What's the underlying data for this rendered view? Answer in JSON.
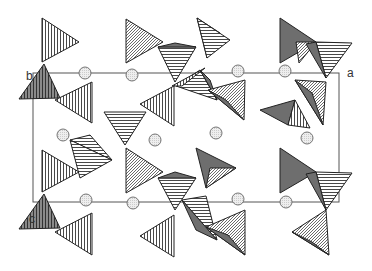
{
  "diagram": {
    "type": "crystal-structure-polyhedral-projection",
    "colors": {
      "background": "#ffffff",
      "dark_face": "#6e6e6e",
      "outline": "#222222",
      "cell_line": "#555555",
      "atom_fill": "#e6e6e6",
      "atom_stroke": "#666666"
    },
    "unit_cell": {
      "x": 33,
      "y": 73,
      "width": 306,
      "height": 129
    },
    "axis_labels": [
      {
        "id": "b",
        "text": "b",
        "x": 26,
        "y": 69
      },
      {
        "id": "a",
        "text": "a",
        "x": 347,
        "y": 66
      },
      {
        "id": "c",
        "text": "c",
        "x": 29,
        "y": 212
      }
    ],
    "atoms": [
      {
        "x": 85,
        "y": 73
      },
      {
        "x": 132,
        "y": 75
      },
      {
        "x": 238,
        "y": 71
      },
      {
        "x": 285,
        "y": 71
      },
      {
        "x": 63,
        "y": 135
      },
      {
        "x": 155,
        "y": 140
      },
      {
        "x": 216,
        "y": 133
      },
      {
        "x": 307,
        "y": 138
      },
      {
        "x": 86,
        "y": 200
      },
      {
        "x": 133,
        "y": 203
      },
      {
        "x": 238,
        "y": 199
      },
      {
        "x": 286,
        "y": 202
      }
    ],
    "polyhedra": [
      {
        "pts": "42,18 42,62 79,42",
        "fill": "vstripe"
      },
      {
        "pts": "19,99 44,64 60,98",
        "fill": "vstripe-dark"
      },
      {
        "pts": "55,100 92,82 92,123",
        "fill": "vstripe"
      },
      {
        "pts": "126,19 126,63 163,42",
        "fill": "diag"
      },
      {
        "pts": "158,47 196,47 175,82",
        "fill": "hstripe"
      },
      {
        "pts": "158,47 175,43 196,47",
        "fill": "dark"
      },
      {
        "pts": "197,18 220,33 207,58",
        "fill": "dark"
      },
      {
        "pts": "197,18 207,58 230,40",
        "fill": "hstripe"
      },
      {
        "pts": "280,18 280,63 316,42",
        "fill": "dark"
      },
      {
        "pts": "296,42 316,42 299,63",
        "fill": "diag"
      },
      {
        "pts": "316,42 352,43 326,78",
        "fill": "hstripe"
      },
      {
        "pts": "306,44 326,78 316,42",
        "fill": "dark"
      },
      {
        "pts": "176,86 200,70 217,100",
        "fill": "hstripe"
      },
      {
        "pts": "200,70 210,80 217,100",
        "fill": "dark"
      },
      {
        "pts": "182,86 205,68 172,86",
        "fill": "vstripe"
      },
      {
        "pts": "140,104 174,86 174,126",
        "fill": "vstripe"
      },
      {
        "pts": "104,112 146,112 125,145",
        "fill": "hstripe"
      },
      {
        "pts": "208,90 245,80 244,120",
        "fill": "diag"
      },
      {
        "pts": "208,90 226,100 244,120",
        "fill": "dark"
      },
      {
        "pts": "260,110 295,100 288,125",
        "fill": "dark"
      },
      {
        "pts": "288,125 295,100 310,128",
        "fill": "vstripe"
      },
      {
        "pts": "295,80 326,82 323,125",
        "fill": "diag"
      },
      {
        "pts": "295,80 312,93 323,125",
        "fill": "dark"
      },
      {
        "pts": "70,140 90,135 112,160",
        "fill": "hstripe"
      },
      {
        "pts": "70,140 80,178 112,160",
        "fill": "hstripe"
      },
      {
        "pts": "42,150 42,192 79,172",
        "fill": "vstripe"
      },
      {
        "pts": "126,148 126,193 163,172",
        "fill": "diag"
      },
      {
        "pts": "158,178 196,178 175,210",
        "fill": "hstripe"
      },
      {
        "pts": "158,178 175,172 196,178",
        "fill": "dark"
      },
      {
        "pts": "196,148 236,168 206,188",
        "fill": "dark"
      },
      {
        "pts": "210,168 236,168 206,188",
        "fill": "diag"
      },
      {
        "pts": "280,148 280,193 316,172",
        "fill": "dark"
      },
      {
        "pts": "316,172 352,173 326,210",
        "fill": "hstripe"
      },
      {
        "pts": "306,174 326,210 316,172",
        "fill": "dark"
      },
      {
        "pts": "19,229 44,194 60,228",
        "fill": "vstripe-dark"
      },
      {
        "pts": "55,232 92,213 92,255",
        "fill": "vstripe"
      },
      {
        "pts": "140,236 174,215 174,257",
        "fill": "vstripe"
      },
      {
        "pts": "182,200 206,196 217,240",
        "fill": "hstripe"
      },
      {
        "pts": "182,200 196,230 217,240",
        "fill": "dark"
      },
      {
        "pts": "206,227 245,210 245,255",
        "fill": "diag"
      },
      {
        "pts": "206,227 228,235 245,255",
        "fill": "dark"
      },
      {
        "pts": "292,232 326,210 329,255",
        "fill": "diag"
      },
      {
        "pts": "292,232 312,242 329,255",
        "fill": "dark"
      }
    ]
  }
}
